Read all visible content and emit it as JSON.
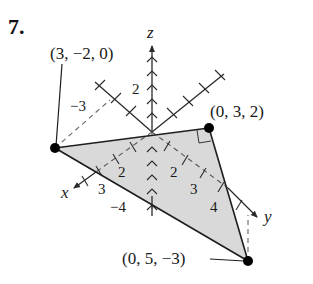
{
  "problem_number": "7.",
  "axes": {
    "x_label": "x",
    "y_label": "y",
    "z_label": "z",
    "tick_labels": {
      "z_pos_2": "2",
      "z_neg_4": "−4",
      "y_neg_3": "−3",
      "x_2": "2",
      "x_3": "3",
      "y_2": "2",
      "y_3": "3",
      "y_4": "4"
    }
  },
  "points": [
    {
      "label": "(3, −2, 0)",
      "coords": [
        3,
        -2,
        0
      ]
    },
    {
      "label": "(0, 3, 2)",
      "coords": [
        0,
        3,
        2
      ]
    },
    {
      "label": "(0, 5, −3)",
      "coords": [
        0,
        5,
        -3
      ]
    }
  ],
  "shape": {
    "type": "triangle",
    "fill_color": "#d9d9d9",
    "right_angle_at": "(0, 3, 2)"
  },
  "colors": {
    "line": "#2a2a2a",
    "point": "#000000",
    "dashed": "#555555"
  }
}
